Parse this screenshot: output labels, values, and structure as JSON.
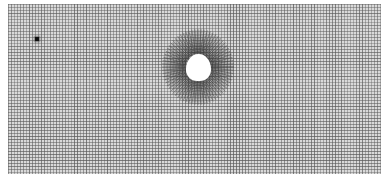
{
  "figure": {
    "kind": "computational mesh",
    "colors": {
      "background": "#ffffff",
      "mesh_line": "#5a5a5a",
      "refined_mesh_line": "#3c3c3c",
      "obstacle": "#ffffff",
      "probe_point": "#111111"
    },
    "elements": [
      {
        "name": "background-mesh",
        "type": "uniform grid"
      },
      {
        "name": "refined-region",
        "type": "radial refinement"
      },
      {
        "name": "obstacle-hole",
        "type": "circular cutout"
      },
      {
        "name": "probe-point",
        "type": "marker"
      }
    ]
  }
}
